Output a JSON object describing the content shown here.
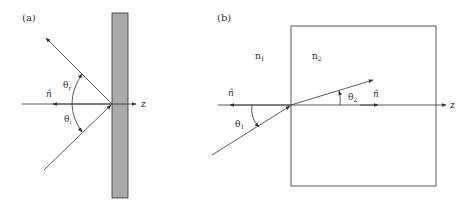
{
  "panel_a": {
    "label": "(a)",
    "normal_label": "n̂",
    "angle_reflected": "θ",
    "angle_reflected_sub": "r",
    "angle_incident": "θ",
    "angle_incident_sub": "i",
    "axis_label": "z",
    "slab_color": "#a9a9a9"
  },
  "panel_b": {
    "label": "(b)",
    "medium1": "n",
    "medium1_sub": "1",
    "medium2": "n",
    "medium2_sub": "2",
    "normal_label_left": "n̂",
    "normal_label_right": "n̂",
    "angle_1": "θ",
    "angle_1_sub": "1",
    "angle_2": "θ",
    "angle_2_sub": "2",
    "axis_label": "z"
  },
  "colors": {
    "line": "#333333",
    "slab": "#a9a9a9"
  }
}
